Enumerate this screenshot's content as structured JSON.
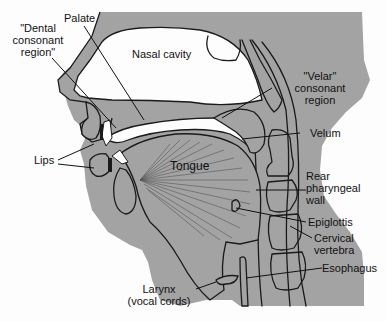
{
  "figure": {
    "type": "anatomical cross-section (sagittal) of the human vocal tract",
    "colors": {
      "tissue": "#a3a3a3",
      "outline": "#1a1a1a",
      "background": "#fdfdfd",
      "text": "#111111"
    }
  },
  "labels": {
    "palate": "Palate",
    "dental_line1": "\"Dental",
    "dental_line2": "consonant",
    "dental_line3": "region\"",
    "nasal_cavity": "Nasal cavity",
    "velar_line1": "\"Velar\"",
    "velar_line2": "consonant",
    "velar_line3": "region",
    "velum": "Velum",
    "lips": "Lips",
    "tongue": "Tongue",
    "rear_line1": "Rear",
    "rear_line2": "pharyngeal",
    "rear_line3": "wall",
    "epiglottis": "Epiglottis",
    "cervical_line1": "Cervical",
    "cervical_line2": "vertebra",
    "esophagus": "Esophagus",
    "larynx_line1": "Larynx",
    "larynx_line2": "(vocal cords)"
  }
}
